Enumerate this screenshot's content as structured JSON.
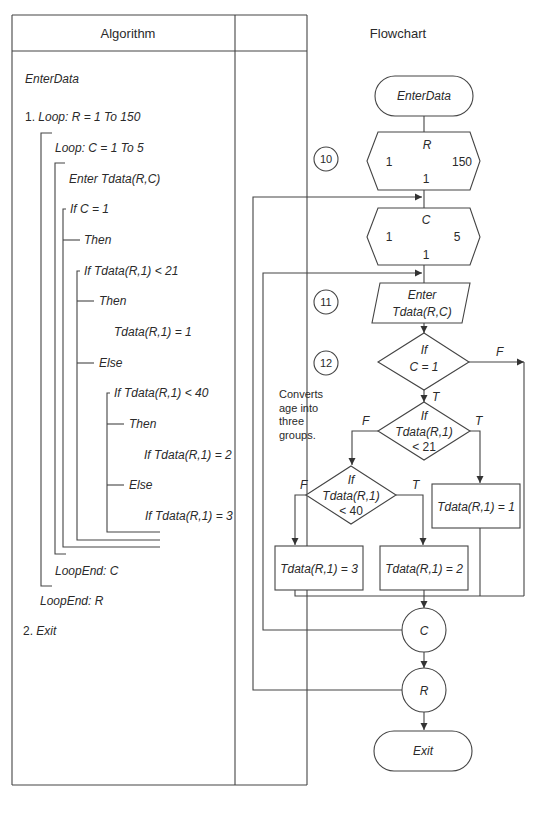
{
  "table": {
    "headers": {
      "algorithm": "Algorithm",
      "flowchart": "Flowchart"
    }
  },
  "algorithm": {
    "title": "EnterData",
    "lines": [
      {
        "prefix": "1. ",
        "text": "Loop: R = 1 To 150"
      },
      {
        "text": "Loop: C = 1 To 5"
      },
      {
        "text": "Enter Tdata(R,C)"
      },
      {
        "text": "If C = 1"
      },
      {
        "text": "Then"
      },
      {
        "text": "If Tdata(R,1) < 21"
      },
      {
        "text": "Then"
      },
      {
        "text": "Tdata(R,1) = 1"
      },
      {
        "text": "Else"
      },
      {
        "text": "If Tdata(R,1) < 40"
      },
      {
        "text": "Then"
      },
      {
        "text": "If Tdata(R,1) = 2"
      },
      {
        "text": "Else"
      },
      {
        "text": "If Tdata(R,1) = 3"
      },
      {
        "text": "LoopEnd: C"
      },
      {
        "text": "LoopEnd: R"
      },
      {
        "prefix": "2. ",
        "text": "Exit"
      }
    ]
  },
  "flowchart": {
    "start": "EnterData",
    "loop_r": {
      "var": "R",
      "start": "1",
      "end": "150",
      "step": "1",
      "marker": "10"
    },
    "loop_c": {
      "var": "C",
      "start": "1",
      "end": "5",
      "step": "1"
    },
    "input": {
      "line1": "Enter",
      "line2": "Tdata(R,C)",
      "marker": "11"
    },
    "decision1": {
      "line1": "If",
      "line2": "C = 1",
      "marker": "12",
      "true_label": "T",
      "false_label": "F"
    },
    "annotation": [
      "Converts",
      "age into",
      "three",
      "groups."
    ],
    "decision2": {
      "line1": "If",
      "line2": "Tdata(R,1)",
      "line3": "< 21",
      "true_label": "T",
      "false_label": "F"
    },
    "decision3": {
      "line1": "If",
      "line2": "Tdata(R,1)",
      "line3": "< 40",
      "true_label": "T",
      "false_label": "F"
    },
    "process1": "Tdata(R,1) = 1",
    "process2": "Tdata(R,1) = 2",
    "process3": "Tdata(R,1) = 3",
    "connector_c": "C",
    "connector_r": "R",
    "end": "Exit"
  }
}
